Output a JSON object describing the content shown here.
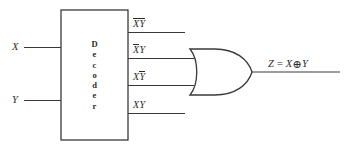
{
  "diagram": {
    "background_color": "#ffffff",
    "line_color": "#3a3a3a",
    "text_color": "#2b2b2b"
  },
  "decoder": {
    "label": "Decoder",
    "letters": [
      "D",
      "e",
      "c",
      "o",
      "d",
      "e",
      "r"
    ]
  },
  "inputs": [
    {
      "label": "X",
      "name": "input-x"
    },
    {
      "label": "Y",
      "name": "input-y"
    }
  ],
  "outputs": [
    {
      "id": "m0",
      "base": "X",
      "base_bar": true,
      "second": "Y",
      "second_bar": true,
      "connected_to_or": false
    },
    {
      "id": "m1",
      "base": "X",
      "base_bar": true,
      "second": "Y",
      "second_bar": false,
      "connected_to_or": true
    },
    {
      "id": "m2",
      "base": "X",
      "base_bar": false,
      "second": "Y",
      "second_bar": true,
      "connected_to_or": true
    },
    {
      "id": "m3",
      "base": "X",
      "base_bar": false,
      "second": "Y",
      "second_bar": false,
      "connected_to_or": false
    }
  ],
  "or_gate": {
    "name": "or-gate",
    "type": "OR"
  },
  "output": {
    "var": "Z",
    "equals": "=",
    "operand_left": "X",
    "operator": "⊕",
    "operand_right": "Y"
  }
}
